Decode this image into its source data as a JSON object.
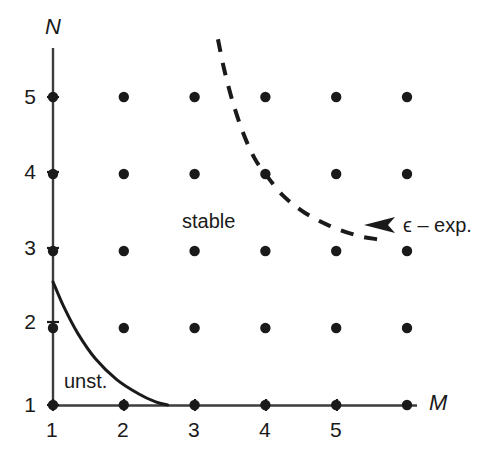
{
  "figure": {
    "background": "#ffffff",
    "ink_color": "#1a1a1a",
    "axis_color": "#3c3c3c"
  },
  "axes": {
    "y_name": "N",
    "x_name": "M",
    "y_ticks": [
      "5",
      "4",
      "3",
      "2",
      "1"
    ],
    "x_ticks": [
      "1",
      "2",
      "3",
      "4",
      "5"
    ]
  },
  "annotations": {
    "stable": "stable",
    "unstable": "unst.",
    "epsilon_expansion": "ϵ – exp."
  },
  "chart_data": {
    "type": "scatter",
    "title": "",
    "xlabel": "M",
    "ylabel": "N",
    "xlim": [
      0.55,
      6.3
    ],
    "ylim": [
      0.55,
      5.75
    ],
    "grid": false,
    "legend": "none",
    "xticks": [
      1,
      2,
      3,
      4,
      5
    ],
    "yticks": [
      1,
      2,
      3,
      4,
      5
    ],
    "lattice_points": {
      "name": "integer lattice of (M, N)",
      "marker": "filled-circle",
      "color": "#1a1a1a",
      "x": [
        1,
        2,
        3,
        4,
        5,
        6,
        1,
        2,
        3,
        4,
        5,
        6,
        1,
        2,
        3,
        4,
        5,
        6,
        1,
        2,
        3,
        4,
        5,
        6,
        1,
        2,
        3,
        4,
        5,
        6
      ],
      "y": [
        1,
        1,
        1,
        1,
        1,
        1,
        2,
        2,
        2,
        2,
        2,
        2,
        3,
        3,
        3,
        3,
        3,
        3,
        4,
        4,
        4,
        4,
        4,
        4,
        5,
        5,
        5,
        5,
        5,
        5
      ]
    },
    "series": [
      {
        "name": "stability boundary",
        "style": "solid",
        "color": "#1a1a1a",
        "width": 3,
        "points": [
          [
            1.0,
            2.6
          ],
          [
            1.15,
            2.28
          ],
          [
            1.35,
            1.93
          ],
          [
            1.6,
            1.6
          ],
          [
            1.9,
            1.33
          ],
          [
            2.2,
            1.15
          ],
          [
            2.45,
            1.04
          ],
          [
            2.62,
            1.0
          ]
        ]
      },
      {
        "name": "ϵ – exp.",
        "style": "dashed",
        "color": "#1a1a1a",
        "width": 4,
        "dash": "13 11",
        "points": [
          [
            3.33,
            5.75
          ],
          [
            3.42,
            5.35
          ],
          [
            3.55,
            4.9
          ],
          [
            3.7,
            4.5
          ],
          [
            3.85,
            4.2
          ],
          [
            4.0,
            4.0
          ],
          [
            4.25,
            3.72
          ],
          [
            4.55,
            3.5
          ],
          [
            4.9,
            3.33
          ],
          [
            5.3,
            3.2
          ],
          [
            5.6,
            3.15
          ]
        ],
        "arrow": {
          "direction": "left",
          "at": [
            5.6,
            3.15
          ],
          "label": "ϵ – exp."
        }
      }
    ],
    "region_labels": [
      {
        "text": "stable",
        "x": 2.9,
        "y": 3.45
      },
      {
        "text": "unst.",
        "x": 1.35,
        "y": 1.28
      }
    ]
  }
}
